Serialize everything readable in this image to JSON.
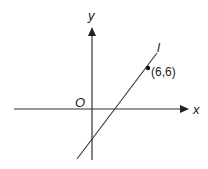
{
  "diagram": {
    "axes": {
      "x_label": "x",
      "y_label": "y",
      "origin_label": "O"
    },
    "line": {
      "label": "l",
      "point_label": "(6,6)",
      "point": [
        6,
        6
      ]
    },
    "colors": {
      "stroke": "#333333",
      "text": "#222222",
      "background": "#ffffff"
    }
  }
}
